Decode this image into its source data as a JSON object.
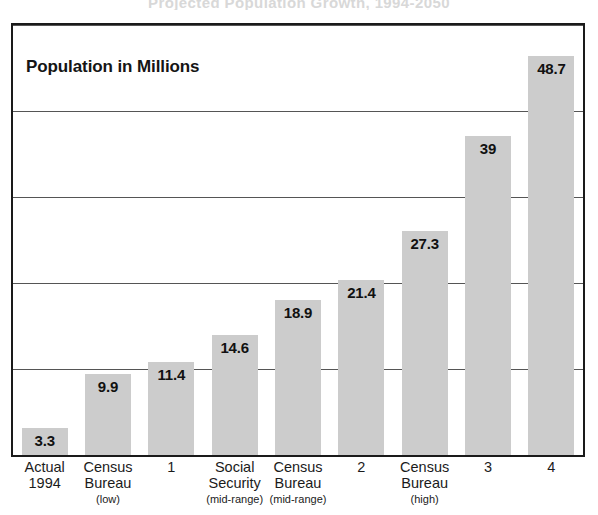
{
  "page": {
    "ghost_headline": "Projected Population Growth, 1994-2050"
  },
  "chart_data": {
    "type": "bar",
    "title": "Population in Millions",
    "xlabel": "",
    "ylabel": "",
    "ylim": [
      0,
      52.5
    ],
    "grid": true,
    "gridlines": [
      0,
      10.5,
      21,
      31.5,
      42,
      52.5
    ],
    "legend": "none",
    "bar_color": "#cccccc",
    "categories": [
      "Actual 1994",
      "Census Bureau (low)",
      "1",
      "Social Security (mid-range)",
      "Census Bureau (mid-range)",
      "2",
      "Census Bureau (high)",
      "3",
      "4"
    ],
    "values": [
      3.3,
      9.9,
      11.4,
      14.6,
      18.9,
      21.4,
      27.3,
      39,
      48.7
    ],
    "value_labels": [
      "3.3",
      "9.9",
      "11.4",
      "14.6",
      "18.9",
      "21.4",
      "27.3",
      "39",
      "48.7"
    ],
    "bars": [
      {
        "value_label": "3.3",
        "value": 3.3,
        "label_line1": "Actual",
        "label_line2": "1994",
        "label_sub": ""
      },
      {
        "value_label": "9.9",
        "value": 9.9,
        "label_line1": "Census",
        "label_line2": "Bureau",
        "label_sub": "(low)"
      },
      {
        "value_label": "11.4",
        "value": 11.4,
        "label_line1": "1",
        "label_line2": "",
        "label_sub": ""
      },
      {
        "value_label": "14.6",
        "value": 14.6,
        "label_line1": "Social",
        "label_line2": "Security",
        "label_sub": "(mid-range)"
      },
      {
        "value_label": "18.9",
        "value": 18.9,
        "label_line1": "Census",
        "label_line2": "Bureau",
        "label_sub": "(mid-range)"
      },
      {
        "value_label": "21.4",
        "value": 21.4,
        "label_line1": "2",
        "label_line2": "",
        "label_sub": ""
      },
      {
        "value_label": "27.3",
        "value": 27.3,
        "label_line1": "Census",
        "label_line2": "Bureau",
        "label_sub": "(high)"
      },
      {
        "value_label": "39",
        "value": 39,
        "label_line1": "3",
        "label_line2": "",
        "label_sub": ""
      },
      {
        "value_label": "48.7",
        "value": 48.7,
        "label_line1": "4",
        "label_line2": "",
        "label_sub": ""
      }
    ]
  }
}
